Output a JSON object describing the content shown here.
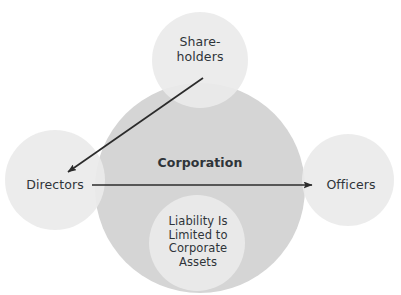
{
  "diagram": {
    "background_color": "#ffffff",
    "text_color": "#2f3439",
    "circle_fill_light": "#eaeaea",
    "circle_fill_medium": "#d5d5d5",
    "arrow_color": "#2b2b2b",
    "nodes": {
      "shareholders": {
        "label": "Share-\nholders",
        "cx": 200,
        "cy": 60,
        "r": 48,
        "fill": "#eaeaea"
      },
      "corporation": {
        "label": "Corporation",
        "cx": 200,
        "cy": 188,
        "r": 105,
        "fill": "#d5d5d5"
      },
      "directors": {
        "label": "Directors",
        "cx": 55,
        "cy": 180,
        "r": 50,
        "fill": "#eaeaea"
      },
      "officers": {
        "label": "Officers",
        "cx": 348,
        "cy": 180,
        "r": 46,
        "fill": "#eaeaea"
      },
      "liability": {
        "label": "Liability Is\nLimited to\nCorporate\nAssets",
        "cx": 197,
        "cy": 243,
        "r": 48,
        "fill": "#eaeaea"
      }
    },
    "arrows": [
      {
        "name": "shareholders-to-directors",
        "from": "shareholders",
        "to": "directors",
        "x1": 203,
        "y1": 78,
        "x2": 68,
        "y2": 172
      },
      {
        "name": "directors-to-officers",
        "from": "directors",
        "to": "officers",
        "x1": 92,
        "y1": 185,
        "x2": 312,
        "y2": 185
      }
    ]
  }
}
